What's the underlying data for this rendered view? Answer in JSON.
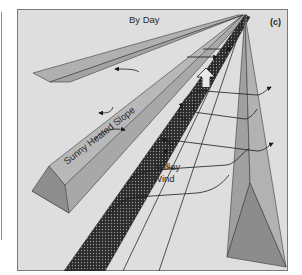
{
  "figure": {
    "title": "By Day",
    "panel_label": "(c)",
    "labels": {
      "slope": "Sunny Heated Slope",
      "valley_wind_line1": "Valley",
      "valley_wind_line2": "Wind"
    },
    "colors": {
      "background": "#dedede",
      "frame": "#7a7a7a",
      "ridge_light": "#b4b4b4",
      "ridge_mid": "#9c9c9c",
      "ridge_dark": "#888888",
      "river": "#2e2e2e",
      "lines": "#2a2a2a"
    }
  }
}
